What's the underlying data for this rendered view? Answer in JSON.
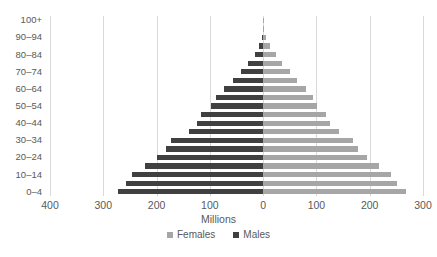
{
  "chart_data": {
    "type": "bar",
    "subtype": "population-pyramid",
    "title": "",
    "xlabel": "Millions",
    "ylabel": "",
    "orientation": "horizontal",
    "grid": true,
    "legend_position": "bottom",
    "axis": {
      "xlim": [
        -400,
        300
      ],
      "x_ticks": [
        -400,
        -300,
        -200,
        -100,
        0,
        100,
        200,
        300
      ],
      "x_tick_labels": [
        "400",
        "300",
        "200",
        "100",
        "0",
        "100",
        "200",
        "300"
      ]
    },
    "categories": [
      "0–4",
      "5–9",
      "10–14",
      "15–19",
      "20–24",
      "25–29",
      "30–34",
      "35–39",
      "40–44",
      "45–49",
      "50–54",
      "55–59",
      "60–64",
      "65–69",
      "70–74",
      "75–79",
      "80–84",
      "85–89",
      "90–94",
      "95–99",
      "100+"
    ],
    "visible_category_labels": [
      "0–4",
      "10–14",
      "20–24",
      "30–34",
      "40–44",
      "50–54",
      "60–64",
      "70–74",
      "80–84",
      "90–94",
      "100+"
    ],
    "series": [
      {
        "name": "Males",
        "color": "#404040",
        "direction": "left",
        "values": [
          273,
          258,
          246,
          222,
          199,
          183,
          172,
          140,
          124,
          116,
          97,
          88,
          73,
          56,
          41,
          28,
          16,
          8,
          3,
          1,
          0.2
        ]
      },
      {
        "name": "Females",
        "color": "#a6a6a6",
        "direction": "right",
        "values": [
          268,
          252,
          240,
          218,
          195,
          178,
          168,
          142,
          126,
          118,
          101,
          93,
          81,
          64,
          50,
          36,
          24,
          13,
          5,
          1.5,
          0.3
        ]
      }
    ]
  },
  "legend": {
    "items": [
      {
        "label": "Females",
        "color": "#a6a6a6"
      },
      {
        "label": "Males",
        "color": "#404040"
      }
    ]
  },
  "colors": {
    "male": "#404040",
    "female": "#a6a6a6",
    "grid": "#d9d9d9",
    "text": "#595959",
    "background": "#ffffff"
  }
}
